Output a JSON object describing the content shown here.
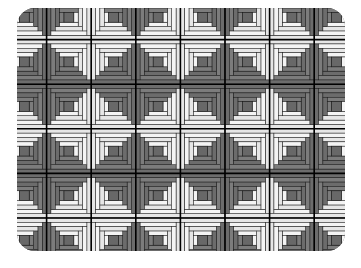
{
  "image": {
    "subject": "log cabin quilt pattern",
    "description": "Grid of log cabin quilt blocks forming alternating light and dark diamonds"
  },
  "pattern": {
    "columns": 8,
    "rows": 6,
    "block_size": 44.6,
    "rings": 4,
    "origin": [
      2,
      -5
    ],
    "colors": {
      "light": "#e6e6e6",
      "light_alt": "#f4f4f4",
      "dark": "#6c6c6c",
      "dark_alt": "#7c7c7c",
      "center": "#686868",
      "line": "#1a1a1a",
      "seam": "#000000",
      "background": "#ffffff"
    }
  }
}
